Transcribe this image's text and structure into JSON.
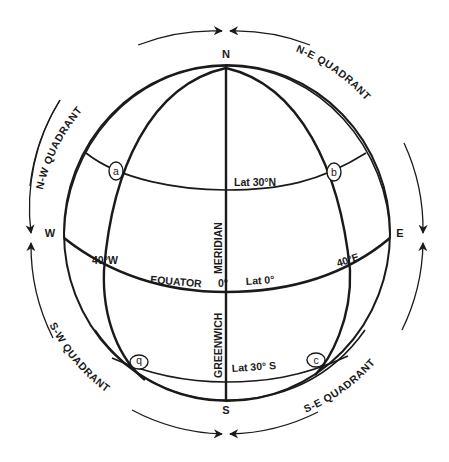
{
  "diagram": {
    "type": "globe-quadrants",
    "cardinals": {
      "north": "N",
      "south": "S",
      "west": "W",
      "east": "E"
    },
    "quadrants": {
      "nw": "N-W  QUADRANT",
      "ne": "N-E  QUADRANT",
      "sw": "S-W  QUADRANT",
      "se": "S-E  QUADRANT"
    },
    "meridian": {
      "upper": "MERIDIAN",
      "lower": "GREENWICH",
      "value": "0°"
    },
    "equator": {
      "label": "EQUATOR",
      "lat": "Lat 0°"
    },
    "latitudes": {
      "north": "Lat  30°N",
      "south": "Lat 30° S"
    },
    "longitudes": {
      "west": "40°W",
      "east": "40°E"
    },
    "points": {
      "a": "a",
      "b_north": "b",
      "b_south": "b",
      "c": "c"
    },
    "colors": {
      "ink": "#1a1a1a",
      "background": "#ffffff"
    }
  }
}
